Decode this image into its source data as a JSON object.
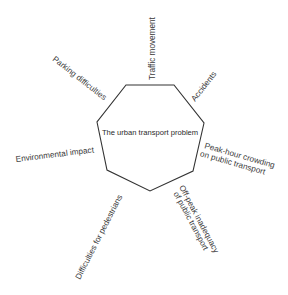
{
  "diagram": {
    "type": "radial-concept",
    "center": {
      "label": "The urban transport problem",
      "shape": "heptagon"
    },
    "factors": [
      {
        "id": "traffic-movement",
        "lines": [
          "Traffic movement"
        ]
      },
      {
        "id": "accidents",
        "lines": [
          "Accidents"
        ]
      },
      {
        "id": "peak-hour-crowding",
        "lines": [
          "Peak-hour crowding",
          "on public transport"
        ]
      },
      {
        "id": "off-peak-inadequacy",
        "lines": [
          "Off-peak inadequacy",
          "of public transport"
        ]
      },
      {
        "id": "difficulties-for-pedestrians",
        "lines": [
          "Difficulties for pedestrians"
        ]
      },
      {
        "id": "environmental-impact",
        "lines": [
          "Environmental impact"
        ]
      },
      {
        "id": "parking-difficulties",
        "lines": [
          "Parking difficulties"
        ]
      }
    ],
    "colors": {
      "stroke": "#333333",
      "text": "#3a3a3a",
      "background": "#ffffff"
    }
  }
}
